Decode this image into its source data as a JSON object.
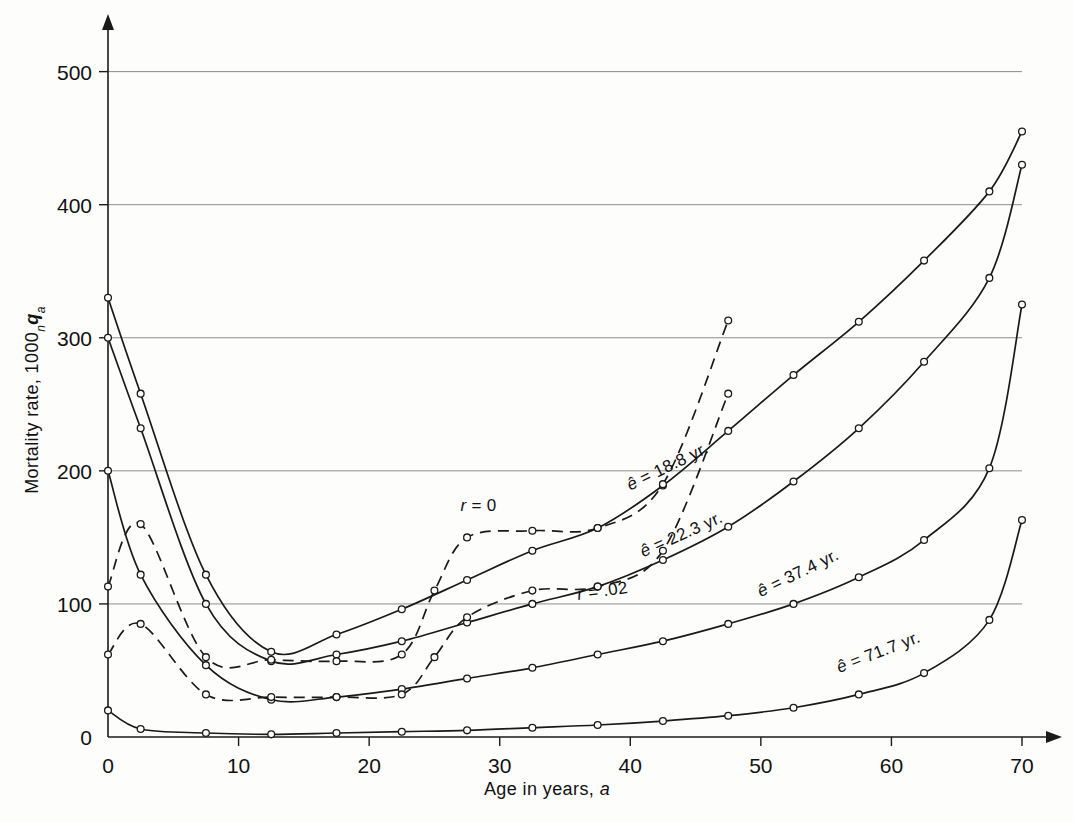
{
  "chart_data": {
    "type": "line",
    "title": "",
    "xlabel": "Age in years, a",
    "ylabel": "Mortality rate, 1000 n q a",
    "ylabel_parts": {
      "main": "Mortality rate, 1000",
      "sub_n": "n",
      "sym_q": "q",
      "sub_a": "a"
    },
    "xlim": [
      0,
      70
    ],
    "ylim": [
      0,
      520
    ],
    "xticks": [
      0,
      10,
      20,
      30,
      40,
      50,
      60,
      70
    ],
    "xtick_labels": [
      "0",
      "10",
      "20",
      "30",
      "40",
      "50",
      "60",
      "70"
    ],
    "yticks": [
      100,
      200,
      300,
      400,
      500
    ],
    "ytick_labels": [
      "100",
      "200",
      "300",
      "400",
      "500"
    ],
    "grid": "horizontal-only",
    "legend_position": "inline-curve-labels",
    "marker": "open-circle",
    "x": [
      0,
      2.5,
      7.5,
      12.5,
      17.5,
      22.5,
      27.5,
      32.5,
      37.5,
      42.5,
      47.5,
      52.5,
      57.5,
      62.5,
      67.5,
      70
    ],
    "series": [
      {
        "name": "e = 18.8 yr.",
        "label": "ê = 18.8 yr.",
        "style": "solid",
        "values": [
          330,
          258,
          122,
          64,
          77,
          96,
          118,
          140,
          157,
          189,
          230,
          272,
          312,
          358,
          410,
          455
        ]
      },
      {
        "name": "e = 22.3 yr.",
        "label": "ê = 22.3 yr.",
        "style": "solid",
        "values": [
          300,
          232,
          100,
          57,
          62,
          72,
          86,
          100,
          113,
          133,
          158,
          192,
          232,
          282,
          345,
          430
        ]
      },
      {
        "name": "e = 37.4 yr.",
        "label": "ê = 37.4 yr.",
        "style": "solid",
        "values": [
          200,
          122,
          54,
          28,
          30,
          36,
          44,
          52,
          62,
          72,
          85,
          100,
          120,
          148,
          202,
          325
        ]
      },
      {
        "name": "e = 71.7 yr.",
        "label": "ê = 71.7 yr.",
        "style": "solid",
        "values": [
          20,
          6,
          3,
          2,
          3,
          4,
          5,
          7,
          9,
          12,
          16,
          22,
          32,
          48,
          88,
          163
        ]
      },
      {
        "name": "r = 0",
        "label": "r = 0",
        "style": "dashed",
        "x": [
          0,
          2.5,
          7.5,
          12.5,
          17.5,
          22.5,
          25,
          27.5,
          32.5,
          37.5,
          42.5,
          47.5
        ],
        "values": [
          113,
          160,
          60,
          58,
          57,
          62,
          110,
          150,
          155,
          157,
          190,
          313
        ]
      },
      {
        "name": "r = .02",
        "label": "r = .02",
        "style": "dashed",
        "x": [
          0,
          2.5,
          7.5,
          12.5,
          17.5,
          22.5,
          25,
          27.5,
          32.5,
          37.5,
          42.5,
          47.5
        ],
        "values": [
          62,
          85,
          32,
          30,
          30,
          32,
          60,
          90,
          110,
          113,
          140,
          258
        ]
      }
    ],
    "annotations": [
      {
        "text": "ê = 18.8 yr.",
        "x": 40,
        "y": 185,
        "rotation": -26
      },
      {
        "text": "ê = 22.3 yr.",
        "x": 41,
        "y": 135,
        "rotation": -24
      },
      {
        "text": "ê = 37.4 yr.",
        "x": 50,
        "y": 105,
        "rotation": -26
      },
      {
        "text": "ê = 71.7 yr.",
        "x": 56,
        "y": 48,
        "rotation": -21
      },
      {
        "text": "r = 0",
        "x": 27,
        "y": 170,
        "rotation": 0
      },
      {
        "text": "r = .02",
        "x": 36,
        "y": 103,
        "rotation": -8
      }
    ]
  }
}
